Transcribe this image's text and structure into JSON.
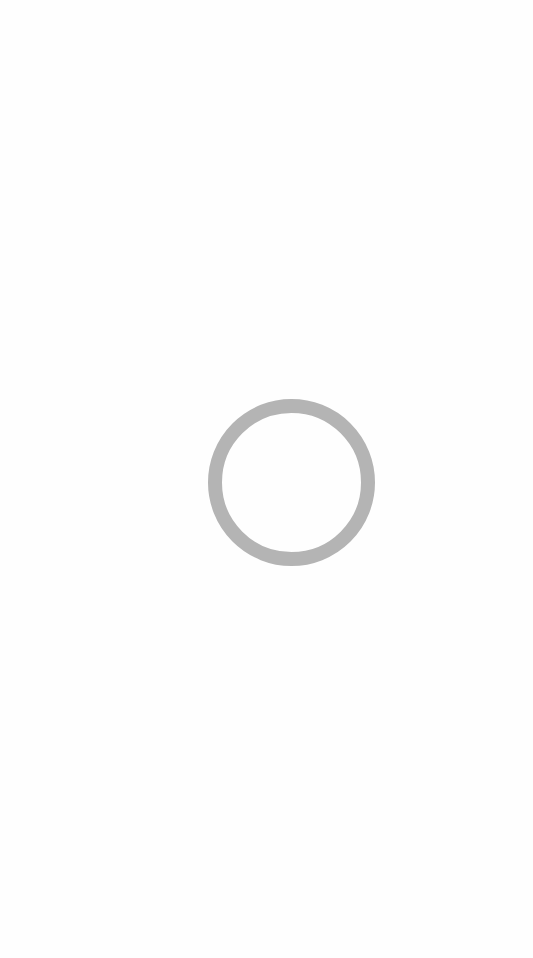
{
  "screen": {
    "state": "loading",
    "background_color": "#fefefe"
  },
  "spinner": {
    "icon": "loading-ring-icon",
    "color": "#b4b4b4",
    "label": ""
  }
}
